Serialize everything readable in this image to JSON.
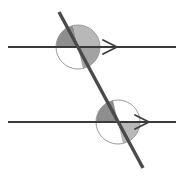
{
  "figure": {
    "width": 184,
    "height": 178,
    "background_color": "#ffffff"
  },
  "colors": {
    "line_stroke": "#3a3a3a",
    "transversal_stroke": "#4a4a4a",
    "circle_outline": "#9a9a9a",
    "sector_dark": "#8e8e8e",
    "sector_medium": "#a3a3a3",
    "sector_light": "#b8b8b8",
    "arrow_stroke": "#3f3f3f"
  },
  "strokes": {
    "parallel_line_width": 2.2,
    "transversal_width": 3.4,
    "circle_outline_width": 1.0,
    "arrow_width": 1.8
  },
  "parallel_lines": [
    {
      "name": "upper-parallel-line",
      "x1": 8,
      "y1": 47,
      "x2": 176,
      "y2": 47,
      "arrow_marker_x": 112,
      "arrow_marker_y": 47,
      "arrow_size": 9,
      "marker_glyph": ">"
    },
    {
      "name": "lower-parallel-line",
      "x1": 8,
      "y1": 122,
      "x2": 176,
      "y2": 122,
      "arrow_marker_x": 144,
      "arrow_marker_y": 122,
      "arrow_size": 9,
      "marker_glyph": ">"
    }
  ],
  "transversal": {
    "name": "transversal-line",
    "x1": 59,
    "y1": 12,
    "x2": 143,
    "y2": 168
  },
  "intersections": [
    {
      "name": "upper-intersection",
      "cx": 78,
      "cy": 47,
      "radius": 22,
      "sectors": [
        {
          "name": "upper-left-sector",
          "start_deg": 180,
          "end_deg": 257,
          "fill": "#8e8e8e"
        },
        {
          "name": "upper-right-sector",
          "start_deg": 257,
          "end_deg": 360,
          "fill": "#b8b8b8"
        },
        {
          "name": "lower-right-sector",
          "start_deg": 0,
          "end_deg": 77,
          "fill": "#a3a3a3"
        }
      ]
    },
    {
      "name": "lower-intersection",
      "cx": 118,
      "cy": 122,
      "radius": 22,
      "sectors": [
        {
          "name": "upper-left-sector",
          "start_deg": 180,
          "end_deg": 257,
          "fill": "#8e8e8e"
        },
        {
          "name": "lower-right-sector",
          "start_deg": 0,
          "end_deg": 77,
          "fill": "#b8b8b8"
        }
      ]
    }
  ]
}
